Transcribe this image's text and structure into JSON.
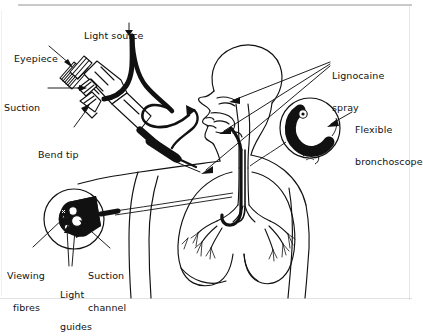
{
  "figure": {
    "ink_color": "#111111",
    "background_color": "#ffffff",
    "scan_edge_color": "#c9c9c9"
  },
  "labels": {
    "light_source": "Light source",
    "eyepiece": "Eyepiece",
    "suction": "Suction",
    "bend_tip": "Bend tip",
    "lignocaine_spray_line1": "Lignocaine",
    "lignocaine_spray_line2": "spray",
    "flexible_bronchoscope_line1": "Flexible",
    "flexible_bronchoscope_line2": "bronchoscope",
    "viewing_fibres_line1": "Viewing",
    "viewing_fibres_line2": "fibres",
    "light_guides_line1": "Light",
    "light_guides_line2": "guides",
    "suction_channel_line1": "Suction",
    "suction_channel_line2": "channel"
  },
  "parts": {
    "instrument": "bronchoscope-handle",
    "patient": "head-and-thorax-figure",
    "inset_airway": "magnified-airway-view",
    "inset_crosssection": "magnified-tip-cross-section"
  }
}
